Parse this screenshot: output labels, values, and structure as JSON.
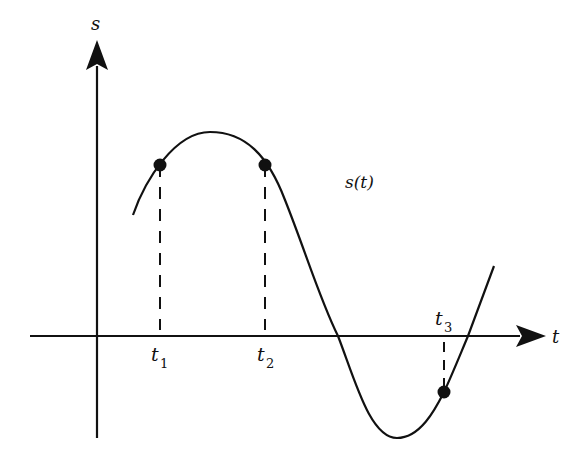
{
  "diagram": {
    "type": "function-graph",
    "axes": {
      "vertical_label": "s",
      "horizontal_label": "t"
    },
    "curve_label": "s(t)",
    "points": [
      {
        "name": "t",
        "subscript": "1",
        "position": "above axis, near rising side of maximum"
      },
      {
        "name": "t",
        "subscript": "2",
        "position": "above axis, falling side of maximum"
      },
      {
        "name": "t",
        "subscript": "3",
        "position": "below axis, rising side after minimum"
      }
    ],
    "colors": {
      "stroke": "#111111",
      "background": "#ffffff"
    }
  }
}
